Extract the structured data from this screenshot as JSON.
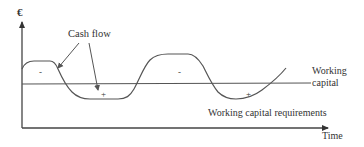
{
  "diagram": {
    "y_axis_symbol": "€",
    "x_axis_label": "Time",
    "labels": {
      "cash_flow": "Cash flow",
      "working_capital_line1": "Working",
      "working_capital_line2": "capital",
      "wcr": "Working capital requirements"
    },
    "signs": [
      {
        "text": "-",
        "x": 40,
        "y": 74
      },
      {
        "text": "+",
        "x": 104,
        "y": 97
      },
      {
        "text": "-",
        "x": 180,
        "y": 74
      },
      {
        "text": "+",
        "x": 248,
        "y": 97
      }
    ],
    "colors": {
      "axis": "#333333",
      "curve": "#555555",
      "text": "#333333"
    }
  }
}
